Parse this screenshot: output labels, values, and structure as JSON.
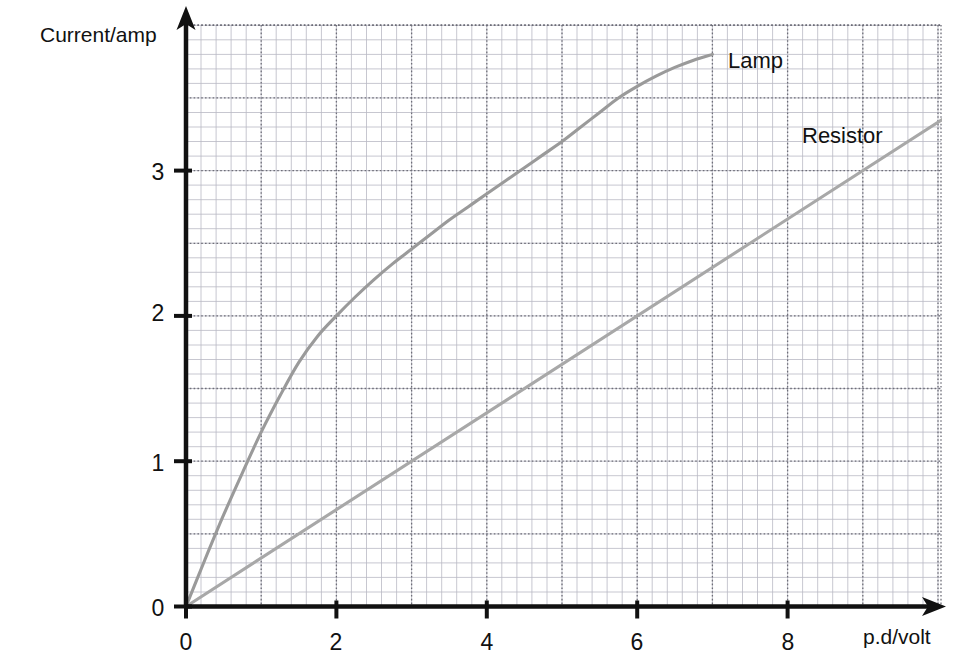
{
  "chart_data": {
    "type": "line",
    "title": "",
    "xlabel": "p.d/volt",
    "ylabel": "Current/amp",
    "xlim": [
      0,
      10.1
    ],
    "ylim": [
      0,
      4.0
    ],
    "xticks": [
      "0",
      "2",
      "4",
      "6",
      "8"
    ],
    "xtick_values": [
      0,
      2,
      4,
      6,
      8
    ],
    "yticks": [
      "0",
      "1",
      "2",
      "3"
    ],
    "ytick_values": [
      0,
      1,
      2,
      3
    ],
    "grid": true,
    "grid_minor_spacing_x": 0.2,
    "grid_minor_spacing_y": 0.1,
    "grid_major_spacing_x": 1,
    "grid_major_spacing_y": 0.5,
    "legend_position": "inline-end-of-curve",
    "series": [
      {
        "name": "Lamp",
        "color": "#9a9a9a",
        "label_x": 7.2,
        "label_y": 3.85,
        "x": [
          0,
          0.25,
          0.5,
          0.75,
          1.0,
          1.25,
          1.5,
          1.75,
          2.0,
          2.25,
          2.5,
          2.75,
          3.0,
          3.25,
          3.5,
          3.75,
          4.0,
          4.25,
          4.5,
          4.75,
          5.0,
          5.25,
          5.5,
          5.75,
          6.0,
          6.25,
          6.5,
          6.75,
          7.0
        ],
        "y": [
          0,
          0.32,
          0.63,
          0.92,
          1.2,
          1.45,
          1.68,
          1.86,
          2.0,
          2.13,
          2.25,
          2.36,
          2.46,
          2.56,
          2.66,
          2.75,
          2.84,
          2.93,
          3.02,
          3.11,
          3.2,
          3.3,
          3.4,
          3.5,
          3.58,
          3.65,
          3.71,
          3.76,
          3.8
        ]
      },
      {
        "name": "Resistor",
        "color": "#a8a8a8",
        "label_x": 8.25,
        "label_y": 3.28,
        "x": [
          0,
          10.05
        ],
        "y": [
          0,
          3.35
        ]
      }
    ],
    "annotations": [
      {
        "text": "Lamp",
        "x": 7.2,
        "y": 3.85
      },
      {
        "text": "Resistor",
        "x": 8.25,
        "y": 3.28
      }
    ]
  },
  "axes": {
    "y_axis_title": "Current/amp",
    "x_axis_title": "p.d/volt",
    "y_tick_0": "0",
    "y_tick_1": "1",
    "y_tick_2": "2",
    "y_tick_3": "3",
    "x_tick_0": "0",
    "x_tick_2": "2",
    "x_tick_4": "4",
    "x_tick_6": "6",
    "x_tick_8": "8"
  },
  "colors": {
    "axis": "#111111",
    "grid_minor": "#b9b9c4",
    "grid_major": "#6e6e78",
    "lamp": "#9a9a9a",
    "resistor": "#a8a8a8",
    "background": "#ffffff"
  }
}
